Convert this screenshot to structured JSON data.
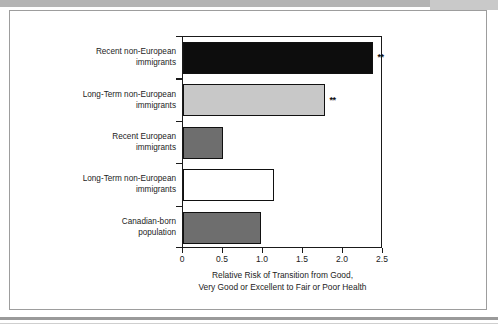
{
  "chart_data": {
    "type": "bar",
    "orientation": "horizontal",
    "title": "",
    "xlabel": "Relative Risk of Transition from Good, Very Good or Excellent to Fair or Poor Health",
    "xlabel_line1": "Relative Risk of Transition from Good,",
    "xlabel_line2": "Very Good or Excellent to Fair or Poor Health",
    "ylabel": "",
    "xlim": [
      0,
      2.5
    ],
    "xticks": [
      0,
      0.5,
      1.0,
      1.5,
      2.0,
      2.5
    ],
    "xtick_labels": [
      "0",
      "0.5",
      "1.0",
      "1.5",
      "2.0",
      "2.5"
    ],
    "grid": false,
    "legend": false,
    "categories": [
      "Recent non-European immigrants",
      "Long-Term non-European immigrants",
      "Recent European immigrants",
      "Long-Term non-European immigrants",
      "Canadian-born population"
    ],
    "category_lines": [
      [
        "Recent non-European",
        "immigrants"
      ],
      [
        "Long-Term non-European",
        "immigrants"
      ],
      [
        "Recent European",
        "immigrants"
      ],
      [
        "Long-Term non-European",
        "immigrants"
      ],
      [
        "Canadian-born",
        "population"
      ]
    ],
    "values": [
      2.38,
      1.78,
      0.5,
      1.14,
      0.98
    ],
    "bar_colors": [
      "#0d0d0d",
      "#c8c8c8",
      "#6e6e6e",
      "#ffffff",
      "#6e6e6e"
    ],
    "bar_border_color": "#111111",
    "significance": [
      "**",
      "**",
      "",
      "",
      ""
    ],
    "significance_note": "** denotes statistically significant"
  },
  "figure": {
    "frame_border_color": "#9d9d9d",
    "background": "#ffffff"
  }
}
